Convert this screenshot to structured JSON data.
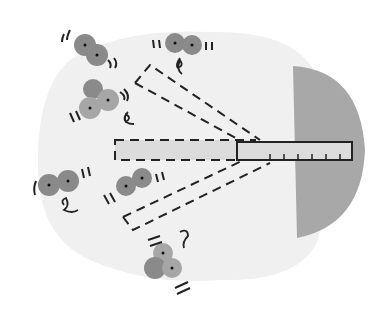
{
  "diagram": {
    "colors": {
      "background": "#ffffff",
      "region": "#f0f0f0",
      "wall": "#a8a8a8",
      "rod_fill": "#dcdcdc",
      "stroke": "#222222",
      "atom_dark": "#8a8a8a",
      "atom_light": "#a6a6a6"
    },
    "elements": {
      "wall": "half-disc wall on right",
      "rod": "ruler with tick marks",
      "rotated_rods": [
        "upper dashed rod",
        "lower dashed rod",
        "horizontal dashed rod"
      ],
      "molecules": [
        "diatomic-top-left",
        "diatomic-top",
        "triatomic-left",
        "diatomic-mid-left",
        "diatomic-center",
        "triatomic-bottom"
      ]
    }
  }
}
